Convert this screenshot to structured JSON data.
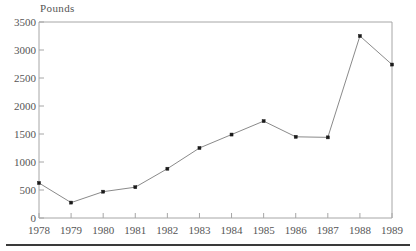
{
  "chart_data": {
    "type": "line",
    "title": "",
    "subtitle": "",
    "xlabel": "",
    "ylabel": "Pounds",
    "categories": [
      "1978",
      "1979",
      "1980",
      "1981",
      "1982",
      "1983",
      "1984",
      "1985",
      "1986",
      "1987",
      "1988",
      "1989"
    ],
    "values": [
      625,
      275,
      470,
      550,
      880,
      1250,
      1490,
      1730,
      1450,
      1440,
      3250,
      2740
    ],
    "series": [
      {
        "name": "Pounds",
        "values": [
          625,
          275,
          470,
          550,
          880,
          1250,
          1490,
          1730,
          1450,
          1440,
          3250,
          2740
        ]
      }
    ],
    "ylim": [
      0,
      3500
    ],
    "y_ticks": [
      0,
      500,
      1000,
      1500,
      2000,
      2500,
      3000,
      3500
    ],
    "y_tick_labels": [
      "0",
      "500",
      "1000",
      "1500",
      "2000",
      "2500",
      "3000",
      "3500"
    ],
    "x_ticks": [
      "1978",
      "1979",
      "1980",
      "1981",
      "1982",
      "1983",
      "1984",
      "1985",
      "1986",
      "1987",
      "1988",
      "1989"
    ],
    "grid": false,
    "legend": false,
    "legend_position": "none",
    "marker": "square",
    "line_color": "#8a8a8a",
    "marker_color": "#1a1a1a",
    "axis_color": "#a6a6a6",
    "text_color": "#555555",
    "background": "#ffffff",
    "annotations": []
  },
  "figure": {
    "y_axis_title": "Pounds",
    "bottom_rule_color": "#3a3a3a"
  }
}
